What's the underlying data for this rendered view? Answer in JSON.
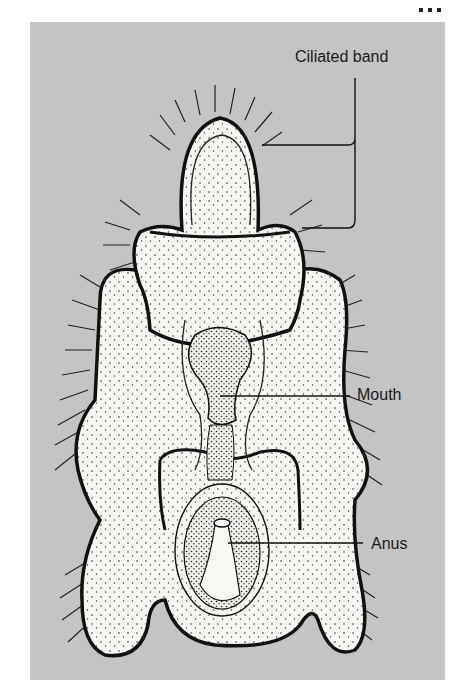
{
  "figure": {
    "background_color": "#c4c4c4",
    "body_fill": "#f4f4f0",
    "outline_color": "#111111"
  },
  "labels": {
    "ciliated_band": "Ciliated band",
    "mouth": "Mouth",
    "anus": "Anus"
  }
}
